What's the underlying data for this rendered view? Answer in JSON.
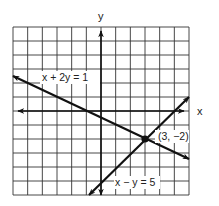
{
  "chart_data": {
    "type": "line",
    "title": "",
    "xlabel": "x",
    "ylabel": "y",
    "xlim": [
      -6,
      6
    ],
    "ylim": [
      -6,
      6
    ],
    "grid": true,
    "grid_step": 1,
    "series": [
      {
        "name": "x + 2y = 1",
        "equation": "x + 2y = 1",
        "slope": -0.5,
        "intercept": 0.5,
        "arrows": "both"
      },
      {
        "name": "x − y = 5",
        "equation": "x - y = 5",
        "slope": 1,
        "intercept": -5,
        "arrows": "both"
      }
    ],
    "points": [
      {
        "x": 3,
        "y": -2,
        "label": "(3, −2)"
      }
    ],
    "annotations": [
      {
        "text": "x + 2y = 1",
        "target": "line 1"
      },
      {
        "text": "x − y = 5",
        "target": "line 2"
      },
      {
        "text": "(3, −2)",
        "target": "intersection point"
      }
    ]
  },
  "labels": {
    "x_axis": "x",
    "y_axis": "y",
    "line1": "x + 2y = 1",
    "line2": "x − y = 5",
    "point": "(3, −2)"
  },
  "colors": {
    "grid": "#333333",
    "lines": "#111111",
    "background": "#ffffff"
  }
}
